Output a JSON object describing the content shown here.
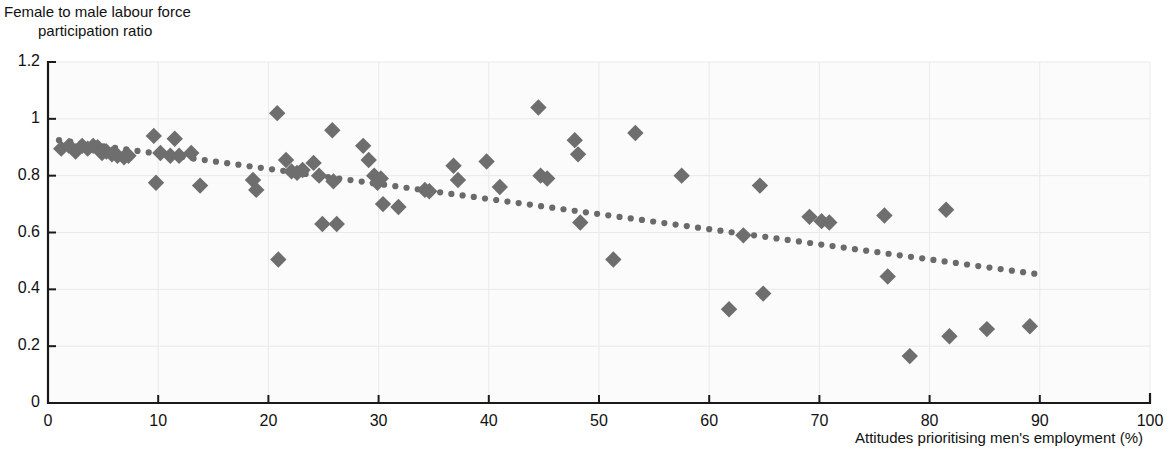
{
  "chart_data": {
    "type": "scatter",
    "title": "",
    "subtitle": "",
    "ylabel_line1": "Female to male labour force",
    "ylabel_line2": "participation ratio",
    "xlabel": "Attitudes prioritising men's employment (%)",
    "xlim": [
      0,
      100
    ],
    "ylim": [
      0,
      1.2
    ],
    "xticks": [
      "0",
      "10",
      "20",
      "30",
      "40",
      "50",
      "60",
      "70",
      "80",
      "90",
      "100"
    ],
    "xtick_values": [
      0,
      10,
      20,
      30,
      40,
      50,
      60,
      70,
      80,
      90,
      100
    ],
    "yticks": [
      "0",
      "0.2",
      "0.4",
      "0.6",
      "0.8",
      "1",
      "1.2"
    ],
    "ytick_values": [
      0,
      0.2,
      0.4,
      0.6,
      0.8,
      1.0,
      1.2
    ],
    "grid": true,
    "legend": null,
    "marker_shape": "diamond",
    "marker_color": "#6e6e6e",
    "trendline": {
      "type": "linear-dotted",
      "color": "#6a6a6a",
      "x_start": 1.0,
      "y_start": 0.925,
      "x_end": 89.5,
      "y_end": 0.455
    },
    "points": [
      {
        "x": 1.2,
        "y": 0.895
      },
      {
        "x": 1.9,
        "y": 0.905
      },
      {
        "x": 2.5,
        "y": 0.885
      },
      {
        "x": 3.1,
        "y": 0.905
      },
      {
        "x": 3.6,
        "y": 0.895
      },
      {
        "x": 4.1,
        "y": 0.905
      },
      {
        "x": 4.5,
        "y": 0.9
      },
      {
        "x": 4.9,
        "y": 0.88
      },
      {
        "x": 5.3,
        "y": 0.885
      },
      {
        "x": 5.8,
        "y": 0.875
      },
      {
        "x": 6.3,
        "y": 0.87
      },
      {
        "x": 6.9,
        "y": 0.865
      },
      {
        "x": 7.3,
        "y": 0.87
      },
      {
        "x": 9.6,
        "y": 0.94
      },
      {
        "x": 9.8,
        "y": 0.775
      },
      {
        "x": 10.2,
        "y": 0.88
      },
      {
        "x": 11.1,
        "y": 0.87
      },
      {
        "x": 11.5,
        "y": 0.93
      },
      {
        "x": 11.9,
        "y": 0.87
      },
      {
        "x": 13.0,
        "y": 0.88
      },
      {
        "x": 13.8,
        "y": 0.765
      },
      {
        "x": 18.6,
        "y": 0.785
      },
      {
        "x": 18.9,
        "y": 0.75
      },
      {
        "x": 20.8,
        "y": 1.02
      },
      {
        "x": 20.9,
        "y": 0.505
      },
      {
        "x": 21.6,
        "y": 0.855
      },
      {
        "x": 22.1,
        "y": 0.815
      },
      {
        "x": 22.6,
        "y": 0.81
      },
      {
        "x": 23.1,
        "y": 0.82
      },
      {
        "x": 24.1,
        "y": 0.845
      },
      {
        "x": 24.6,
        "y": 0.8
      },
      {
        "x": 24.9,
        "y": 0.63
      },
      {
        "x": 25.8,
        "y": 0.96
      },
      {
        "x": 25.9,
        "y": 0.78
      },
      {
        "x": 26.2,
        "y": 0.63
      },
      {
        "x": 28.6,
        "y": 0.905
      },
      {
        "x": 29.1,
        "y": 0.855
      },
      {
        "x": 29.6,
        "y": 0.8
      },
      {
        "x": 29.9,
        "y": 0.775
      },
      {
        "x": 30.2,
        "y": 0.79
      },
      {
        "x": 30.4,
        "y": 0.7
      },
      {
        "x": 31.8,
        "y": 0.69
      },
      {
        "x": 34.2,
        "y": 0.75
      },
      {
        "x": 34.6,
        "y": 0.745
      },
      {
        "x": 36.8,
        "y": 0.835
      },
      {
        "x": 37.2,
        "y": 0.785
      },
      {
        "x": 39.8,
        "y": 0.85
      },
      {
        "x": 41.0,
        "y": 0.76
      },
      {
        "x": 44.5,
        "y": 1.04
      },
      {
        "x": 44.7,
        "y": 0.8
      },
      {
        "x": 45.3,
        "y": 0.79
      },
      {
        "x": 47.8,
        "y": 0.925
      },
      {
        "x": 48.1,
        "y": 0.875
      },
      {
        "x": 48.3,
        "y": 0.635
      },
      {
        "x": 51.3,
        "y": 0.505
      },
      {
        "x": 53.3,
        "y": 0.95
      },
      {
        "x": 57.5,
        "y": 0.8
      },
      {
        "x": 61.8,
        "y": 0.33
      },
      {
        "x": 63.1,
        "y": 0.59
      },
      {
        "x": 64.6,
        "y": 0.765
      },
      {
        "x": 64.9,
        "y": 0.385
      },
      {
        "x": 69.1,
        "y": 0.655
      },
      {
        "x": 70.2,
        "y": 0.64
      },
      {
        "x": 70.9,
        "y": 0.635
      },
      {
        "x": 75.9,
        "y": 0.66
      },
      {
        "x": 76.2,
        "y": 0.445
      },
      {
        "x": 78.2,
        "y": 0.165
      },
      {
        "x": 81.5,
        "y": 0.68
      },
      {
        "x": 81.8,
        "y": 0.235
      },
      {
        "x": 85.2,
        "y": 0.26
      },
      {
        "x": 89.1,
        "y": 0.27
      }
    ]
  }
}
